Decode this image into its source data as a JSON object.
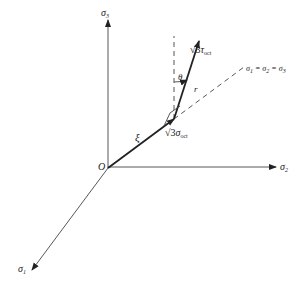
{
  "diagram": {
    "type": "principal-stress-space",
    "axes": [
      {
        "name": "sigma3",
        "symbol": "σ",
        "subscript": "3"
      },
      {
        "name": "sigma2",
        "symbol": "σ",
        "subscript": "2"
      },
      {
        "name": "sigma1",
        "symbol": "σ",
        "subscript": "1"
      }
    ],
    "origin_label": "O",
    "hydrostatic_axis_label": "σ₁ = σ₂ = σ₃",
    "xi_label": "ξ",
    "theta_label": "θ",
    "r_label": "r",
    "deviatoric_label": {
      "prefix": "√3",
      "symbol": "τ",
      "subscript": "oct"
    },
    "hydrostatic_label": {
      "prefix": "√3",
      "symbol": "σ",
      "subscript": "oct"
    }
  }
}
